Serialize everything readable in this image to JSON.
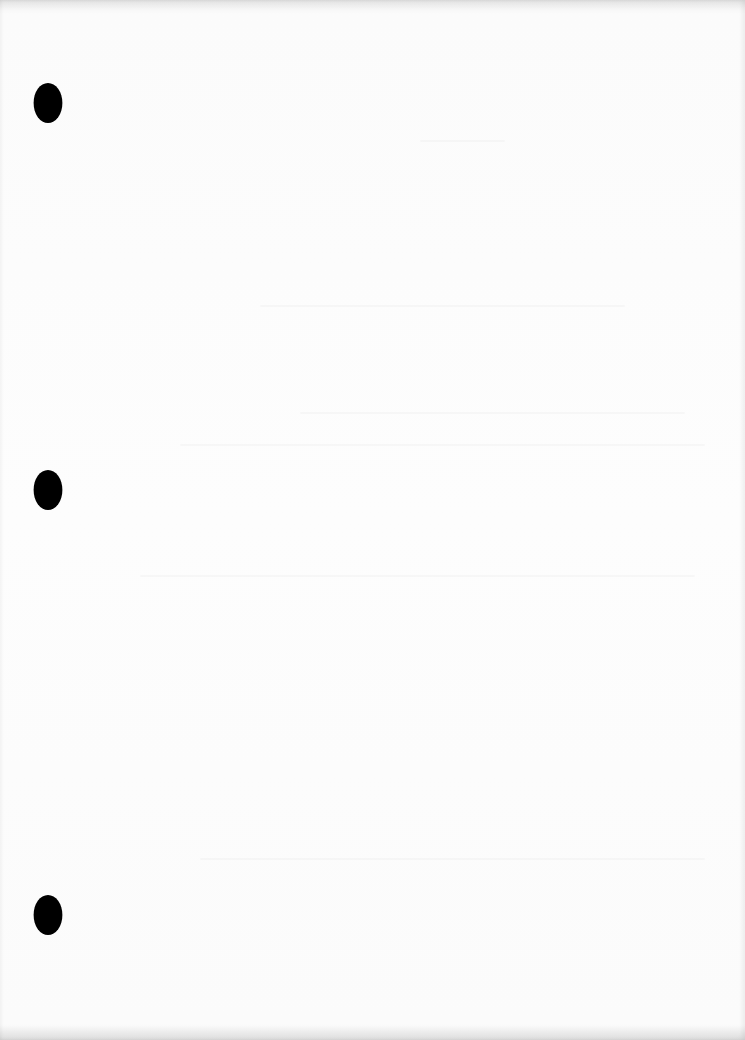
{
  "document": {
    "type": "blank-scanned-page",
    "background_color": "#fdfdfd",
    "text_content": "",
    "punch_holes": [
      {
        "position": "top",
        "color": "#000000"
      },
      {
        "position": "middle",
        "color": "#000000"
      },
      {
        "position": "bottom",
        "color": "#000000"
      }
    ]
  }
}
